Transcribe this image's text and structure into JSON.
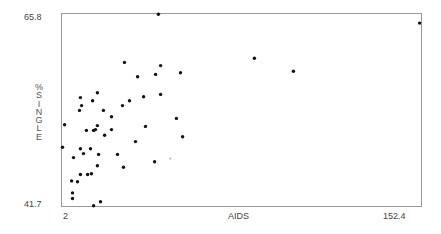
{
  "chart_data": {
    "type": "scatter",
    "title": "",
    "xlabel": "AIDS",
    "ylabel": "%SINGLE",
    "xlim": [
      2,
      152.4
    ],
    "ylim": [
      41.7,
      65.8
    ],
    "x_tick_labels": [
      "2",
      "152.4"
    ],
    "y_tick_labels": [
      "41.7",
      "65.8"
    ],
    "grid": false,
    "legend": null,
    "marker_color": "#111111",
    "frame_color": "#999999",
    "points": [
      {
        "x": 42.5,
        "y": 65.7
      },
      {
        "x": 28.3,
        "y": 59.7
      },
      {
        "x": 43.4,
        "y": 59.3
      },
      {
        "x": 33.8,
        "y": 57.9
      },
      {
        "x": 41.3,
        "y": 58.2
      },
      {
        "x": 51.7,
        "y": 58.4
      },
      {
        "x": 82.6,
        "y": 60.2
      },
      {
        "x": 98.9,
        "y": 58.6
      },
      {
        "x": 151.6,
        "y": 64.6
      },
      {
        "x": 17.0,
        "y": 55.9
      },
      {
        "x": 9.9,
        "y": 55.3
      },
      {
        "x": 15.0,
        "y": 54.9
      },
      {
        "x": 30.4,
        "y": 54.9
      },
      {
        "x": 10.4,
        "y": 54.3
      },
      {
        "x": 27.5,
        "y": 54.3
      },
      {
        "x": 9.5,
        "y": 53.7
      },
      {
        "x": 19.5,
        "y": 53.7
      },
      {
        "x": 22.9,
        "y": 52.9
      },
      {
        "x": 36.3,
        "y": 55.4
      },
      {
        "x": 43.4,
        "y": 55.7
      },
      {
        "x": 50.0,
        "y": 52.7
      },
      {
        "x": 3.3,
        "y": 51.9
      },
      {
        "x": 17.0,
        "y": 51.8
      },
      {
        "x": 12.4,
        "y": 51.2
      },
      {
        "x": 15.4,
        "y": 51.2
      },
      {
        "x": 16.2,
        "y": 51.3
      },
      {
        "x": 22.9,
        "y": 51.3
      },
      {
        "x": 37.1,
        "y": 51.7
      },
      {
        "x": 20.0,
        "y": 50.6
      },
      {
        "x": 32.9,
        "y": 49.8
      },
      {
        "x": 52.6,
        "y": 50.4
      },
      {
        "x": 2.4,
        "y": 49.1
      },
      {
        "x": 9.9,
        "y": 48.9
      },
      {
        "x": 14.1,
        "y": 48.9
      },
      {
        "x": 11.2,
        "y": 48.3
      },
      {
        "x": 17.5,
        "y": 48.2
      },
      {
        "x": 25.4,
        "y": 48.2
      },
      {
        "x": 7.0,
        "y": 47.8
      },
      {
        "x": 40.9,
        "y": 47.3
      },
      {
        "x": 27.9,
        "y": 46.6
      },
      {
        "x": 17.0,
        "y": 46.8
      },
      {
        "x": 9.9,
        "y": 45.7
      },
      {
        "x": 12.9,
        "y": 45.7
      },
      {
        "x": 14.5,
        "y": 45.8
      },
      {
        "x": 6.2,
        "y": 44.9
      },
      {
        "x": 8.7,
        "y": 44.8
      },
      {
        "x": 6.6,
        "y": 43.4
      },
      {
        "x": 6.6,
        "y": 42.7
      },
      {
        "x": 15.4,
        "y": 41.8
      },
      {
        "x": 18.3,
        "y": 42.3
      },
      {
        "x": 47.5,
        "y": 47.7,
        "faint": true
      }
    ]
  },
  "axes": {
    "x_min_label": "2",
    "x_max_label": "152.4",
    "x_title": "AIDS",
    "y_min_label": "41.7",
    "y_max_label": "65.8",
    "y_title_letters": [
      "%",
      "S",
      "I",
      "N",
      "G",
      "L",
      "E"
    ]
  }
}
